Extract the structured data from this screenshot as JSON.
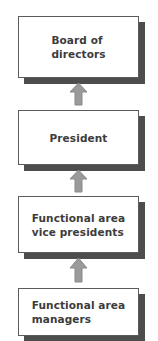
{
  "diagram": {
    "orientation": "vertical-bottom-up",
    "node_fill": "#ffffff",
    "node_border": "#5b5b5b",
    "node_shadow": "#4d4d4d",
    "text_color": "#3c3c3c",
    "arrow_fill": "#9a9a9a",
    "arrow_border": "#8a8a8a",
    "nodes": [
      {
        "id": "board-of-directors",
        "label": "Board of\ndirectors"
      },
      {
        "id": "president",
        "label": "President"
      },
      {
        "id": "functional-area-vice-presidents",
        "label": "Functional area\nvice presidents"
      },
      {
        "id": "functional-area-managers",
        "label": "Functional area\nmanagers"
      }
    ],
    "connectors": [
      {
        "id": "arrow-president-to-board",
        "direction": "up",
        "from": "president",
        "to": "board-of-directors"
      },
      {
        "id": "arrow-vps-to-president",
        "direction": "up",
        "from": "functional-area-vice-presidents",
        "to": "president"
      },
      {
        "id": "arrow-managers-to-vps",
        "direction": "up",
        "from": "functional-area-managers",
        "to": "functional-area-vice-presidents"
      }
    ]
  }
}
